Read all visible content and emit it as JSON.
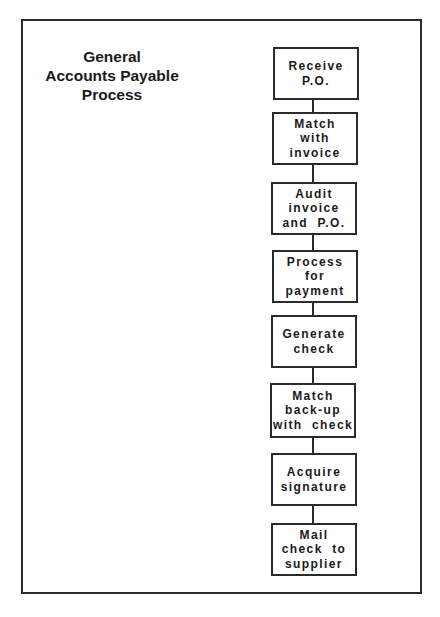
{
  "diagram": {
    "title": [
      "General",
      "Accounts Payable",
      "Process"
    ],
    "type": "flowchart",
    "direction": "top-to-bottom",
    "colors": {
      "line": "#2b2b2b",
      "text": "#1a1a1a",
      "background": "#ffffff"
    },
    "steps": [
      {
        "lines": [
          "Receive",
          "P.O."
        ]
      },
      {
        "lines": [
          "Match",
          "with",
          "invoice"
        ]
      },
      {
        "lines": [
          "Audit",
          "invoice",
          "and  P.O."
        ]
      },
      {
        "lines": [
          "Process",
          "for",
          "payment"
        ]
      },
      {
        "lines": [
          "Generate",
          "check"
        ]
      },
      {
        "lines": [
          "Match",
          "back-up",
          "with  check"
        ]
      },
      {
        "lines": [
          "Acquire",
          "signature"
        ]
      },
      {
        "lines": [
          "Mail",
          "check  to",
          "supplier"
        ]
      }
    ],
    "edges": [
      {
        "from": 0,
        "to": 1
      },
      {
        "from": 1,
        "to": 2
      },
      {
        "from": 2,
        "to": 3
      },
      {
        "from": 3,
        "to": 4
      },
      {
        "from": 4,
        "to": 5
      },
      {
        "from": 5,
        "to": 6
      },
      {
        "from": 6,
        "to": 7
      }
    ]
  }
}
